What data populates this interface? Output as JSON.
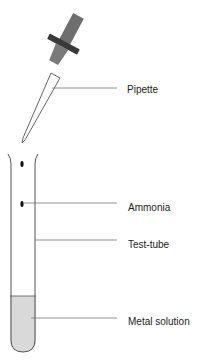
{
  "diagram": {
    "title": "",
    "labels": {
      "pipette": "Pipette",
      "ammonia": "Ammonia",
      "test_tube": "Test-tube",
      "metal_solution": "Metal solution"
    },
    "colors": {
      "bulb": "#6e6e6e",
      "collar": "#3a3a3a",
      "solution": "#d9d9d9",
      "outline": "#555555",
      "leader_line": "#777777",
      "drop": "#111111"
    }
  }
}
